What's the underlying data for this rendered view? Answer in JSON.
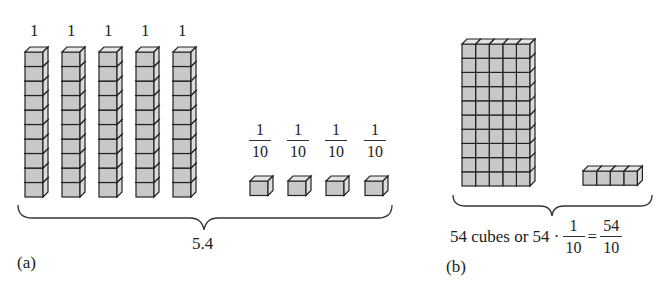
{
  "panel_a": {
    "rod_labels": [
      "1",
      "1",
      "1",
      "1",
      "1"
    ],
    "cube_labels": [
      {
        "num": "1",
        "den": "10"
      },
      {
        "num": "1",
        "den": "10"
      },
      {
        "num": "1",
        "den": "10"
      },
      {
        "num": "1",
        "den": "10"
      }
    ],
    "rods_count": 5,
    "cubes_per_rod": 10,
    "unit_cubes_count": 4,
    "total_label": "5.4",
    "panel_label": "(a)"
  },
  "panel_b": {
    "block_columns": 5,
    "block_rows": 10,
    "extra_cubes": 4,
    "caption_text": "54 cubes or 54 ·",
    "caption_frac": {
      "num": "1",
      "den": "10"
    },
    "equals": "=",
    "result_frac": {
      "num": "54",
      "den": "10"
    },
    "panel_label": "(b)"
  },
  "colors": {
    "cube_fill": "#c8c8c8",
    "cube_side": "#e0e0e0",
    "stroke": "#222222"
  }
}
